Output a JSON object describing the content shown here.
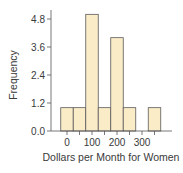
{
  "chart_data": {
    "type": "bar",
    "subtype": "histogram",
    "title": "",
    "xlabel": "Dollars per Month for Women",
    "ylabel": "Frequency",
    "x_ticks": [
      "0",
      "100",
      "200",
      "300"
    ],
    "y_ticks": [
      "0.0",
      "1.2",
      "2.4",
      "3.6",
      "4.8"
    ],
    "ylim": [
      0,
      5.2
    ],
    "bin_width": 50,
    "bins": [
      {
        "start": -25,
        "end": 25,
        "count": 1
      },
      {
        "start": 25,
        "end": 75,
        "count": 1
      },
      {
        "start": 75,
        "end": 125,
        "count": 5
      },
      {
        "start": 125,
        "end": 175,
        "count": 1
      },
      {
        "start": 175,
        "end": 225,
        "count": 4
      },
      {
        "start": 225,
        "end": 275,
        "count": 1
      },
      {
        "start": 275,
        "end": 325,
        "count": 0
      },
      {
        "start": 325,
        "end": 375,
        "count": 1
      }
    ],
    "categories": [
      "0",
      "50",
      "100",
      "150",
      "200",
      "250",
      "300",
      "350"
    ],
    "values": [
      1,
      1,
      5,
      1,
      4,
      1,
      0,
      1
    ],
    "grid": false,
    "legend": null,
    "colors": {
      "bar_fill": "#fbecc8",
      "bar_stroke": "#5a5a5a",
      "axis": "#555555"
    }
  }
}
